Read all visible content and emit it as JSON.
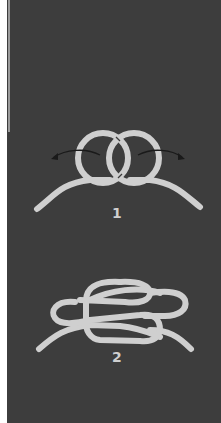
{
  "diagram": {
    "background_color": "#3d3d3d",
    "rope_color": "#cfcfcf",
    "arrow_color": "#1a1a1a",
    "steps": [
      {
        "label": "1",
        "description": "two interlocking loops with arrows pulling outward"
      },
      {
        "label": "2",
        "description": "finished knot with loops drawn tight"
      }
    ]
  }
}
